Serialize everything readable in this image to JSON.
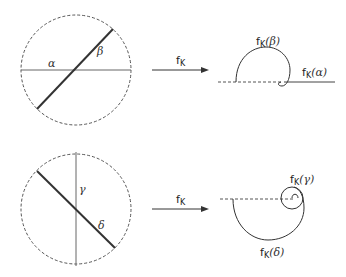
{
  "diagram": {
    "type": "conformal-map-illustration",
    "panels": [
      {
        "id": "top",
        "domain_circle": {
          "style": "dashed"
        },
        "lines": [
          {
            "name": "alpha",
            "label": "α",
            "orientation": "horizontal",
            "weight": "thin"
          },
          {
            "name": "beta",
            "label": "β",
            "orientation": "diagonal-up",
            "weight": "thick"
          }
        ],
        "arrow_label": {
          "base": "f",
          "subscript": "K"
        },
        "image_labels": [
          {
            "text": "f",
            "subscript": "K",
            "arg": "(β)"
          },
          {
            "text": "f",
            "subscript": "K",
            "arg": "(α)"
          }
        ]
      },
      {
        "id": "bottom",
        "domain_circle": {
          "style": "dashed"
        },
        "lines": [
          {
            "name": "gamma",
            "label": "γ",
            "orientation": "vertical",
            "weight": "thin"
          },
          {
            "name": "delta",
            "label": "δ",
            "orientation": "diagonal-down",
            "weight": "thick"
          }
        ],
        "arrow_label": {
          "base": "f",
          "subscript": "K"
        },
        "image_labels": [
          {
            "text": "f",
            "subscript": "K",
            "arg": "(γ)"
          },
          {
            "text": "f",
            "subscript": "K",
            "arg": "(δ)"
          }
        ]
      }
    ]
  },
  "labels": {
    "alpha": "α",
    "beta": "β",
    "gamma": "γ",
    "delta": "δ",
    "f": "f",
    "K": "K",
    "arg_beta": "(β)",
    "arg_alpha": "(α)",
    "arg_gamma": "(γ)",
    "arg_delta": "(δ)"
  },
  "colors": {
    "stroke": "#333333",
    "thin_stroke": "#666666",
    "dashed": "#555555"
  }
}
